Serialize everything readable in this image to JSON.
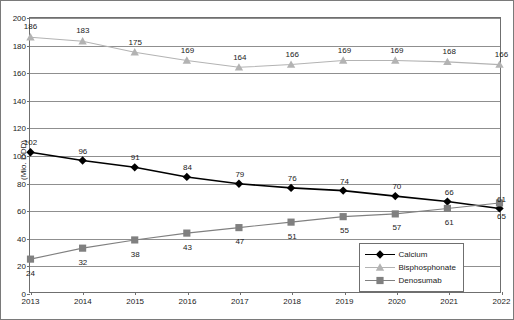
{
  "chart_data": {
    "type": "line",
    "title": "",
    "xlabel": "",
    "ylabel": "(Mio. DDD)",
    "categories": [
      "2013",
      "2014",
      "2015",
      "2016",
      "2017",
      "2018",
      "2019",
      "2020",
      "2021",
      "2022"
    ],
    "x": [
      2013,
      2014,
      2015,
      2016,
      2017,
      2018,
      2019,
      2020,
      2021,
      2022
    ],
    "ylim": [
      0,
      200
    ],
    "yticks": [
      0,
      20,
      40,
      60,
      80,
      100,
      120,
      140,
      160,
      180,
      200
    ],
    "ytick_labels": [
      "0",
      "20",
      "40",
      "60",
      "80",
      "100",
      "120",
      "140",
      "160",
      "180",
      "200"
    ],
    "grid": true,
    "legend_position": "bottom-right",
    "series": [
      {
        "name": "Calcium",
        "color": "#000000",
        "marker": "diamond",
        "values": [
          102,
          96,
          91,
          84,
          79,
          76,
          74,
          70,
          66,
          61
        ],
        "labels": [
          "102",
          "96",
          "91",
          "84",
          "79",
          "76",
          "74",
          "70",
          "66",
          "61"
        ],
        "label_side": [
          "above",
          "above",
          "above",
          "above",
          "above",
          "above",
          "above",
          "above",
          "above",
          "above"
        ]
      },
      {
        "name": "Bisphosphonate",
        "color": "#b3b3b3",
        "marker": "triangle",
        "values": [
          186,
          183,
          175,
          169,
          164,
          166,
          169,
          169,
          168,
          166
        ],
        "labels": [
          "186",
          "183",
          "175",
          "169",
          "164",
          "166",
          "169",
          "169",
          "168",
          "166"
        ],
        "label_side": [
          "above",
          "above",
          "above",
          "above",
          "above",
          "above",
          "above",
          "above",
          "above",
          "above"
        ]
      },
      {
        "name": "Denosumab",
        "color": "#808080",
        "marker": "square",
        "values": [
          24,
          32,
          38,
          43,
          47,
          51,
          55,
          57,
          61,
          65
        ],
        "labels": [
          "24",
          "32",
          "38",
          "43",
          "47",
          "51",
          "55",
          "57",
          "61",
          "65"
        ],
        "label_side": [
          "below",
          "below",
          "below",
          "below",
          "below",
          "below",
          "below",
          "below",
          "below",
          "below"
        ]
      }
    ]
  },
  "legend": {
    "items": [
      {
        "label": "Calcium"
      },
      {
        "label": "Bisphosphonate"
      },
      {
        "label": "Denosumab"
      }
    ]
  }
}
